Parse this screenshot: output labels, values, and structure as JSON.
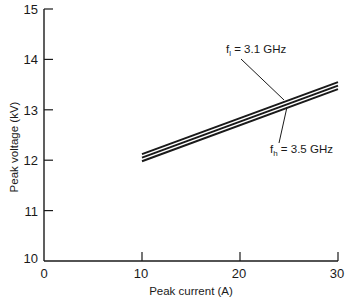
{
  "chart_data": {
    "type": "line",
    "title": "",
    "xlabel": "Peak current (A)",
    "ylabel": "Peak voltage (kV)",
    "xlim": [
      0,
      30
    ],
    "ylim": [
      10,
      15
    ],
    "xticks": [
      0,
      10,
      20,
      30
    ],
    "yticks": [
      10,
      11,
      12,
      13,
      14,
      15
    ],
    "grid": false,
    "legend": "none (inline annotations)",
    "series": [
      {
        "name": "f_l = 3.1 GHz",
        "x": [
          10,
          30
        ],
        "y": [
          12.12,
          13.55
        ]
      },
      {
        "name": "",
        "x": [
          10,
          30
        ],
        "y": [
          12.05,
          13.48
        ]
      },
      {
        "name": "f_h = 3.5 GHz",
        "x": [
          10,
          30
        ],
        "y": [
          11.98,
          13.41
        ]
      }
    ],
    "annotations": [
      {
        "text_main": "f",
        "text_sub": "l",
        "text_rest": " = 3.1 GHz",
        "points_to_series": 0
      },
      {
        "text_main": "f",
        "text_sub": "h",
        "text_rest": " = 3.5 GHz",
        "points_to_series": 2
      }
    ]
  },
  "axes": {
    "x_tick_labels": [
      "0",
      "10",
      "20",
      "30"
    ],
    "y_tick_labels": [
      "10",
      "11",
      "12",
      "13",
      "14",
      "15"
    ],
    "x_title": "Peak current (A)",
    "y_title": "Peak voltage (kV)"
  },
  "colors": {
    "ink": "#1a1a1a",
    "background": "#ffffff"
  }
}
